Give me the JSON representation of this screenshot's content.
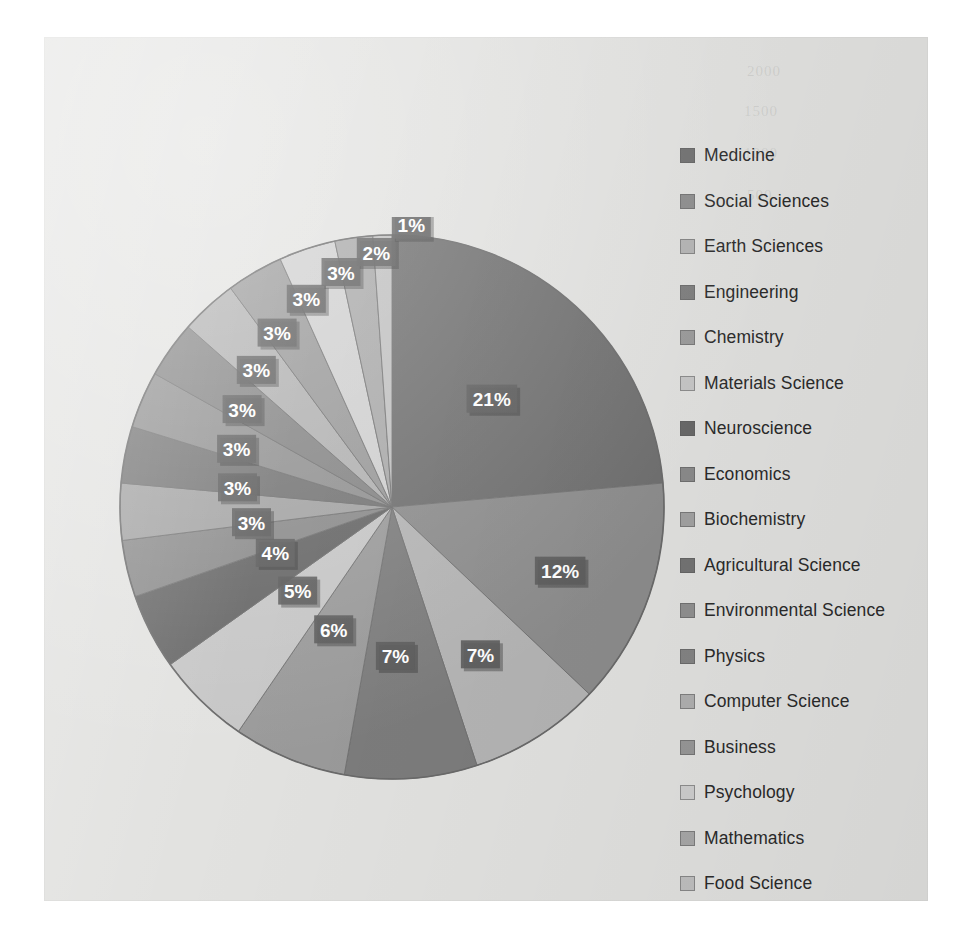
{
  "chart_data": {
    "type": "pie",
    "title": "",
    "legend_position": "right",
    "categories": [
      "Medicine",
      "Social Sciences",
      "Earth Sciences",
      "Engineering",
      "Chemistry",
      "Materials Science",
      "Neuroscience",
      "Economics",
      "Biochemistry",
      "Agricultural Science",
      "Environmental Science",
      "Physics",
      "Computer Science",
      "Business",
      "Psychology",
      "Mathematics",
      "Food Science"
    ],
    "values": [
      21,
      12,
      7,
      7,
      6,
      5,
      4,
      3,
      3,
      3,
      3,
      3,
      3,
      3,
      3,
      2,
      1
    ],
    "data_labels": [
      "21%",
      "12%",
      "7%",
      "7%",
      "6%",
      "5%",
      "4%",
      "3%",
      "3%",
      "3%",
      "3%",
      "3%",
      "3%",
      "3%",
      "3%",
      "2%",
      "1%"
    ],
    "colors": [
      "#6e6e6e",
      "#8c8c8c",
      "#b4b4b4",
      "#7c7c7c",
      "#9a9a9a",
      "#c6c6c6",
      "#666666",
      "#8a8a8a",
      "#a2a2a2",
      "#747474",
      "#909090",
      "#848484",
      "#b0b0b0",
      "#989898",
      "#cfcfcf",
      "#a8a8a8",
      "#c0c0c0"
    ],
    "label_text_color": "#ffffff",
    "label_box_color": "#5b5b5b",
    "start_angle_deg": 0,
    "direction": "clockwise"
  },
  "panel": {
    "background": "#e2e2e0",
    "ghost_marks": [
      "2000",
      "1500",
      "1000",
      "500"
    ]
  }
}
